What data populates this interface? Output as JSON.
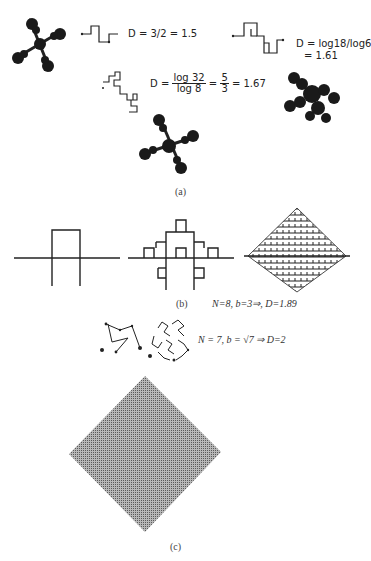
{
  "panel_a": {
    "caption": "(a)",
    "eq1": "D = 3/2 = 1.5",
    "eq1_parts": {
      "lhs": "D =",
      "num": "3",
      "den": "2",
      "rhs": "= 1.5"
    },
    "eq2_line1": "D = log18/log6",
    "eq2_line2": "= 1.61",
    "eq3": {
      "lhs": "D =",
      "num": "log 32",
      "den": "log 8",
      "mid": "=",
      "num2": "5",
      "den2": "3",
      "rhs": "= 1.67"
    }
  },
  "panel_b": {
    "caption": "(b)",
    "formula": "N=8, b=3⇒, D=1.89"
  },
  "panel_c": {
    "caption": "(c)",
    "formula": "N = 7,  b = √7   ⇒  D=2"
  }
}
